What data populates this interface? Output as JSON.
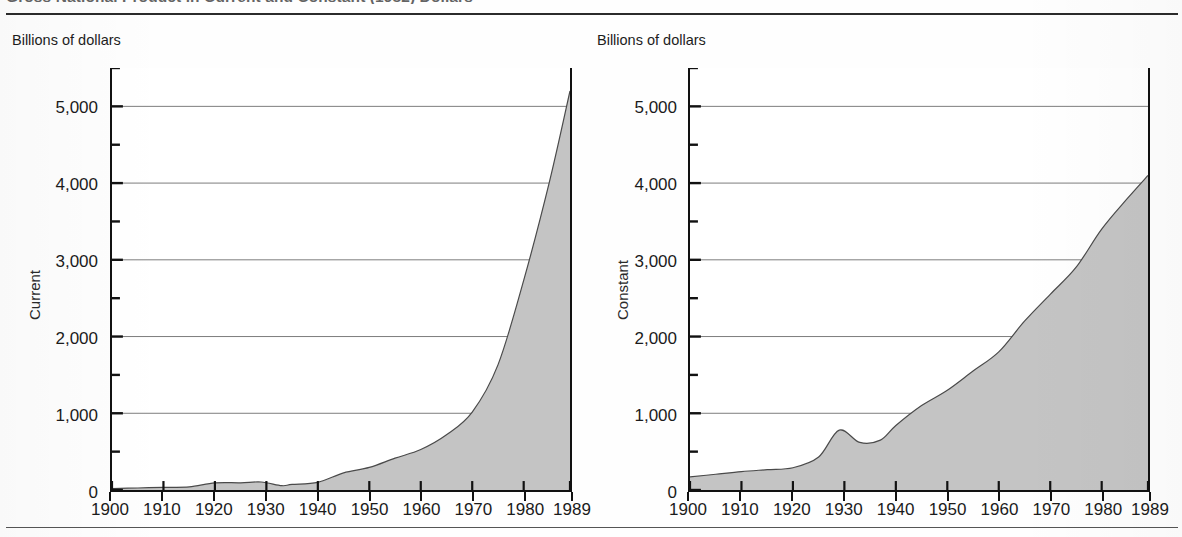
{
  "figure": {
    "title": "Gross National Product in Current and Constant (1982) Dollars",
    "units_label": "Billions of dollars"
  },
  "panels": [
    {
      "id": "current",
      "units_label": "Billions of dollars",
      "axis_title": "Current",
      "y_ticks": [
        "0",
        "1,000",
        "2,000",
        "3,000",
        "4,000",
        "5,000"
      ],
      "x_ticks": [
        "1900",
        "1910",
        "1920",
        "1930",
        "1940",
        "1950",
        "1960",
        "1970",
        "1980",
        "1989"
      ]
    },
    {
      "id": "constant",
      "units_label": "Billions of dollars",
      "axis_title": "Constant",
      "y_ticks": [
        "0",
        "1,000",
        "2,000",
        "3,000",
        "4,000",
        "5,000"
      ],
      "x_ticks": [
        "1900",
        "1910",
        "1920",
        "1930",
        "1940",
        "1950",
        "1960",
        "1970",
        "1980",
        "1989"
      ]
    }
  ],
  "style": {
    "area_fill": "#c4c4c4",
    "area_stroke": "#4a4a4a",
    "gridline": "#5c5c5c",
    "axis": "#111111"
  },
  "chart_data": [
    {
      "type": "area",
      "title": "Gross National Product in Current Dollars",
      "panel_label": "Current",
      "xlabel": "",
      "ylabel": "Billions of dollars",
      "xlim": [
        1900,
        1989
      ],
      "ylim": [
        0,
        5500
      ],
      "grid": true,
      "legend": "none",
      "y_tick_values": [
        0,
        1000,
        2000,
        3000,
        4000,
        5000
      ],
      "y_minor_tick_values": [
        500,
        1500,
        2500,
        3500,
        4500,
        5500
      ],
      "x_tick_values": [
        1900,
        1910,
        1920,
        1930,
        1940,
        1950,
        1960,
        1970,
        1980,
        1989
      ],
      "x": [
        1900,
        1905,
        1910,
        1915,
        1920,
        1925,
        1929,
        1933,
        1935,
        1940,
        1945,
        1950,
        1955,
        1960,
        1965,
        1970,
        1975,
        1980,
        1985,
        1989
      ],
      "values": [
        19,
        26,
        35,
        40,
        92,
        94,
        104,
        56,
        73,
        100,
        223,
        294,
        415,
        527,
        719,
        1016,
        1631,
        2732,
        4015,
        5201
      ]
    },
    {
      "type": "area",
      "title": "Gross National Product in Constant Dollars",
      "panel_label": "Constant",
      "xlabel": "",
      "ylabel": "Billions of dollars",
      "xlim": [
        1900,
        1989
      ],
      "ylim": [
        0,
        5500
      ],
      "grid": true,
      "legend": "none",
      "y_tick_values": [
        0,
        1000,
        2000,
        3000,
        4000,
        5000
      ],
      "y_minor_tick_values": [
        500,
        1500,
        2500,
        3500,
        4500,
        5500
      ],
      "x_tick_values": [
        1900,
        1910,
        1920,
        1930,
        1940,
        1950,
        1960,
        1970,
        1980,
        1989
      ],
      "x": [
        1900,
        1905,
        1910,
        1915,
        1920,
        1925,
        1929,
        1933,
        1937,
        1940,
        1945,
        1950,
        1955,
        1960,
        1965,
        1970,
        1975,
        1980,
        1985,
        1989
      ],
      "values": [
        170,
        205,
        240,
        265,
        290,
        430,
        780,
        620,
        650,
        840,
        1100,
        1300,
        1550,
        1800,
        2200,
        2550,
        2900,
        3400,
        3800,
        4100
      ]
    }
  ]
}
